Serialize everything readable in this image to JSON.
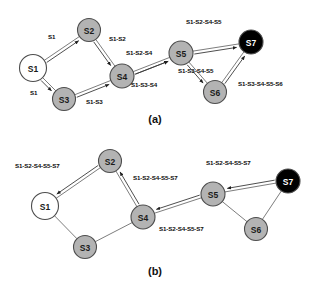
{
  "figure": {
    "width": 318,
    "height": 291,
    "background": "#ffffff"
  },
  "colors": {
    "node_gray_fill": "#b3b3b3",
    "node_white_fill": "#ffffff",
    "node_black_fill": "#000000",
    "node_stroke": "#4d4d4d",
    "edge_stroke": "#6e6e6e",
    "message_stroke": "#3a3a3a",
    "text": "#111111"
  },
  "panels": [
    {
      "id": "panel-a",
      "caption": "(a)",
      "caption_x": 155,
      "caption_y": 123,
      "nodes": [
        {
          "id": "a-s1",
          "label": "S1",
          "x": 33,
          "y": 68,
          "r": 13.5,
          "fill": "white"
        },
        {
          "id": "a-s2",
          "label": "S2",
          "x": 89,
          "y": 30,
          "r": 11.5,
          "fill": "gray"
        },
        {
          "id": "a-s3",
          "label": "S3",
          "x": 64,
          "y": 99,
          "r": 11.5,
          "fill": "gray"
        },
        {
          "id": "a-s4",
          "label": "S4",
          "x": 122,
          "y": 76,
          "r": 12.0,
          "fill": "gray"
        },
        {
          "id": "a-s5",
          "label": "S5",
          "x": 181,
          "y": 53,
          "r": 12.0,
          "fill": "gray"
        },
        {
          "id": "a-s6",
          "label": "S6",
          "x": 215,
          "y": 92,
          "r": 11.5,
          "fill": "gray"
        },
        {
          "id": "a-s7",
          "label": "S7",
          "x": 251,
          "y": 42,
          "r": 12.0,
          "fill": "black"
        }
      ],
      "edges": [
        {
          "id": "a-e-s1-s2",
          "from": "a-s1",
          "to": "a-s2"
        },
        {
          "id": "a-e-s1-s3",
          "from": "a-s1",
          "to": "a-s3"
        },
        {
          "id": "a-e-s2-s4",
          "from": "a-s2",
          "to": "a-s4"
        },
        {
          "id": "a-e-s3-s4",
          "from": "a-s3",
          "to": "a-s4"
        },
        {
          "id": "a-e-s4-s5",
          "from": "a-s4",
          "to": "a-s5"
        },
        {
          "id": "a-e-s5-s7",
          "from": "a-s5",
          "to": "a-s7"
        },
        {
          "id": "a-e-s5-s6",
          "from": "a-s5",
          "to": "a-s6"
        },
        {
          "id": "a-e-s6-s7",
          "from": "a-s6",
          "to": "a-s7"
        }
      ],
      "messages": [
        {
          "id": "a-m1",
          "text": "S1",
          "x": 48,
          "y": 39,
          "from": "a-s1",
          "to": "a-s2"
        },
        {
          "id": "a-m2",
          "text": "S1",
          "x": 30,
          "y": 95,
          "from": "a-s1",
          "to": "a-s3"
        },
        {
          "id": "a-m3",
          "text": "S1-S2",
          "x": 109,
          "y": 41,
          "from": "a-s2",
          "to": "a-s4"
        },
        {
          "id": "a-m4",
          "text": "S1-S3",
          "x": 86,
          "y": 104,
          "from": "a-s3",
          "to": "a-s4"
        },
        {
          "id": "a-m5",
          "text": "S1-S2-S4",
          "x": 126,
          "y": 55,
          "from": "a-s4",
          "to": "a-s5"
        },
        {
          "id": "a-m6",
          "text": "S1-S3-S4",
          "x": 131,
          "y": 87,
          "from": "a-s4",
          "to": "a-s5"
        },
        {
          "id": "a-m7",
          "text": "S1-S2-S4-S5",
          "x": 186,
          "y": 24,
          "from": "a-s5",
          "to": "a-s7"
        },
        {
          "id": "a-m8",
          "text": "S1-S3-S4-S5",
          "x": 178,
          "y": 73,
          "from": "a-s5",
          "to": "a-s6"
        },
        {
          "id": "a-m9",
          "text": "S1-S3-S4-S5-S6",
          "x": 238,
          "y": 86,
          "from": "a-s6",
          "to": "a-s7"
        }
      ]
    },
    {
      "id": "panel-b",
      "caption": "(b)",
      "caption_x": 155,
      "caption_y": 275,
      "nodes": [
        {
          "id": "b-s1",
          "label": "S1",
          "x": 45,
          "y": 206,
          "r": 13.5,
          "fill": "white"
        },
        {
          "id": "b-s2",
          "label": "S2",
          "x": 110,
          "y": 161,
          "r": 11.5,
          "fill": "gray"
        },
        {
          "id": "b-s3",
          "label": "S3",
          "x": 85,
          "y": 247,
          "r": 11.5,
          "fill": "gray"
        },
        {
          "id": "b-s4",
          "label": "S4",
          "x": 143,
          "y": 217,
          "r": 12.0,
          "fill": "gray"
        },
        {
          "id": "b-s5",
          "label": "S5",
          "x": 213,
          "y": 194,
          "r": 12.0,
          "fill": "gray"
        },
        {
          "id": "b-s6",
          "label": "S6",
          "x": 256,
          "y": 229,
          "r": 11.5,
          "fill": "gray"
        },
        {
          "id": "b-s7",
          "label": "S7",
          "x": 288,
          "y": 181,
          "r": 12.0,
          "fill": "black"
        }
      ],
      "edges": [
        {
          "id": "b-e-s1-s2",
          "from": "b-s1",
          "to": "b-s2"
        },
        {
          "id": "b-e-s1-s3",
          "from": "b-s1",
          "to": "b-s3"
        },
        {
          "id": "b-e-s2-s4",
          "from": "b-s2",
          "to": "b-s4"
        },
        {
          "id": "b-e-s3-s4",
          "from": "b-s3",
          "to": "b-s4"
        },
        {
          "id": "b-e-s4-s5",
          "from": "b-s4",
          "to": "b-s5"
        },
        {
          "id": "b-e-s5-s7",
          "from": "b-s5",
          "to": "b-s7"
        },
        {
          "id": "b-e-s5-s6",
          "from": "b-s5",
          "to": "b-s6"
        },
        {
          "id": "b-e-s6-s7",
          "from": "b-s6",
          "to": "b-s7"
        }
      ],
      "messages": [
        {
          "id": "b-m1",
          "text": "S1-S2-S4-S5-S7",
          "x": 15,
          "y": 168,
          "from": "b-s2",
          "to": "b-s1"
        },
        {
          "id": "b-m2",
          "text": "S1-S2-S4-S5-S7",
          "x": 133,
          "y": 180,
          "from": "b-s4",
          "to": "b-s2"
        },
        {
          "id": "b-m3",
          "text": "S1-S2-S4-S5-S7",
          "x": 159,
          "y": 231,
          "from": "b-s5",
          "to": "b-s4"
        },
        {
          "id": "b-m4",
          "text": "S1-S2-S4-S5-S7",
          "x": 206,
          "y": 165,
          "from": "b-s7",
          "to": "b-s5"
        }
      ]
    }
  ]
}
